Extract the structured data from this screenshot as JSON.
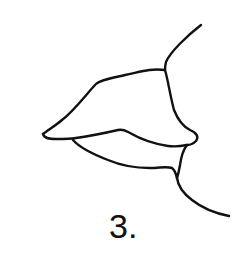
{
  "figure": {
    "label": "3.",
    "stroke_color": "#111111",
    "background_color": "#ffffff"
  }
}
